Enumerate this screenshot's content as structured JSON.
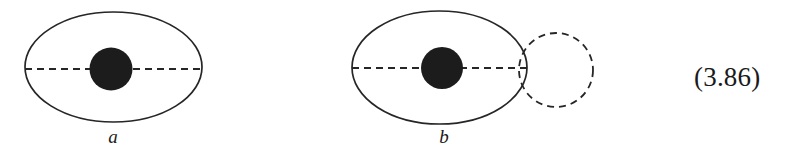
{
  "figure": {
    "caption_number": "(3.86)",
    "background_color": "#ffffff",
    "stroke_color": "#262626",
    "fill_color": "#1c1c1c",
    "panels": [
      {
        "id": "a",
        "label": "a",
        "description": "solid ellipse with filled central disk and dashed horizontal major axis",
        "shapes": {
          "ellipse": {
            "style": "solid",
            "cx": 113.5,
            "cy": 67,
            "rx": 88.5,
            "ry": 55
          },
          "disk": {
            "style": "filled",
            "cx": 111,
            "cy": 69,
            "r": 21.5
          },
          "axis_line": {
            "style": "dashed",
            "x1": 25,
            "x2": 202,
            "y": 69,
            "dash": "7 5"
          }
        }
      },
      {
        "id": "b",
        "label": "b",
        "description": "solid ellipse with filled central disk, dashed horizontal major axis, and an overlapping dashed circle on the right",
        "shapes": {
          "ellipse": {
            "style": "solid",
            "cx": 439.5,
            "cy": 67.5,
            "rx": 87.5,
            "ry": 56.5
          },
          "disk": {
            "style": "filled",
            "cx": 442,
            "cy": 68,
            "r": 21
          },
          "axis_line": {
            "style": "dashed",
            "x1": 352,
            "x2": 527,
            "y": 68,
            "dash": "7 5"
          },
          "dashed_circle": {
            "style": "dashed",
            "cx": 556,
            "cy": 70,
            "r": 37,
            "dash": "7 5"
          }
        }
      }
    ]
  }
}
